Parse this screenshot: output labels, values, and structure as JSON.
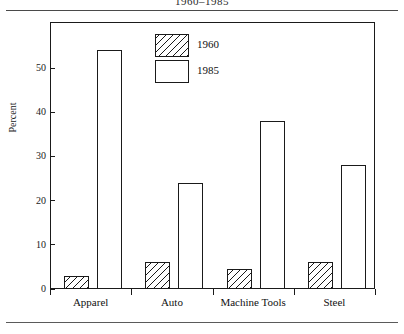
{
  "document": {
    "running_title": "1960–1985"
  },
  "chart_data": {
    "type": "bar",
    "title": "1960–1985",
    "xlabel": "",
    "ylabel": "Percent",
    "categories": [
      "Apparel",
      "Auto",
      "Machine Tools",
      "Steel"
    ],
    "series": [
      {
        "name": "1960",
        "values": [
          3,
          6,
          4.5,
          6
        ],
        "fill": "hatched"
      },
      {
        "name": "1985",
        "values": [
          54,
          24,
          38,
          28
        ],
        "fill": "white"
      }
    ],
    "ylim": [
      0,
      57
    ],
    "yticks": [
      0,
      10,
      20,
      30,
      40,
      50
    ],
    "ytick_labels": [
      "0",
      "10",
      "20",
      "30",
      "40",
      "50"
    ],
    "grid": false,
    "legend_position": "top-center",
    "colors": {
      "ink": "#1a1a1a",
      "background": "#ffffff",
      "rule": "#4a4a4a"
    }
  }
}
